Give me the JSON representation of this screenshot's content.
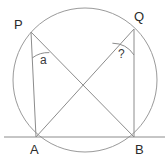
{
  "figure": {
    "kind": "circle-geometry-diagram",
    "width": 168,
    "height": 163,
    "background_color": "#ffffff",
    "stroke_color": "#8c8c8c",
    "text_color": "#2b2b2b"
  },
  "labels": {
    "point_p": "P",
    "point_q": "Q",
    "point_a": "A",
    "point_b": "B",
    "angle_at_p": "a",
    "angle_at_q": "?"
  },
  "geometry": {
    "circle": {
      "cx": 85,
      "cy": 80,
      "r": 72
    },
    "points": {
      "P": {
        "x": 31,
        "y": 32
      },
      "Q": {
        "x": 134,
        "y": 29
      },
      "A": {
        "x": 36,
        "y": 137
      },
      "B": {
        "x": 134,
        "y": 137
      }
    },
    "baseline": {
      "x1": 5,
      "y1": 137,
      "x2": 164,
      "y2": 137
    },
    "segments": [
      {
        "name": "PA",
        "from": "P",
        "to": "A"
      },
      {
        "name": "QB",
        "from": "Q",
        "to": "B"
      },
      {
        "name": "PB",
        "from": "P",
        "to": "B"
      },
      {
        "name": "QA",
        "from": "Q",
        "to": "A"
      }
    ],
    "intersection": {
      "x": 85,
      "y": 88
    },
    "angle_arcs": [
      {
        "name": "arc-at-P",
        "vertex": "P",
        "radius": 26
      },
      {
        "name": "arc-at-Q",
        "vertex": "Q",
        "radius": 26
      }
    ]
  }
}
